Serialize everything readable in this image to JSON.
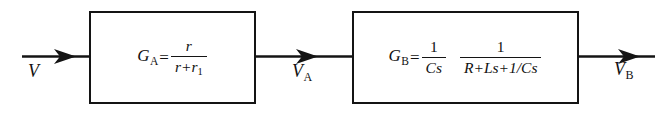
{
  "diagram": {
    "type": "block-diagram",
    "stroke_color": "#141414",
    "background_color": "#ffffff",
    "signal_line_y": 56
  },
  "blocks": [
    {
      "id": "block-a",
      "name": "gain-block-a",
      "gain_symbol": "G",
      "gain_subscript": "A",
      "equals": "=",
      "expression": "G_A = r / (r + r_1)",
      "fraction": {
        "numerator": "r",
        "denominator_terms": [
          "r",
          "+",
          "r"
        ],
        "denominator_subscript": "1"
      }
    },
    {
      "id": "block-b",
      "name": "gain-block-b",
      "gain_symbol": "G",
      "gain_subscript": "B",
      "equals": "=",
      "expression": "G_B = (1 / Cs) (1 / (R + Ls + 1/Cs))",
      "fraction_1": {
        "numerator": "1",
        "denominator": "Cs"
      },
      "fraction_2": {
        "numerator": "1",
        "denominator": "R+Ls+1/Cs"
      }
    }
  ],
  "signals": [
    {
      "id": "signal-v",
      "name": "input-signal-v",
      "symbol": "V",
      "subscript": "",
      "role": "input"
    },
    {
      "id": "signal-va",
      "name": "intermediate-signal-va",
      "symbol": "V",
      "subscript": "A",
      "role": "intermediate"
    },
    {
      "id": "signal-vb",
      "name": "output-signal-vb",
      "symbol": "V",
      "subscript": "B",
      "role": "output"
    }
  ]
}
